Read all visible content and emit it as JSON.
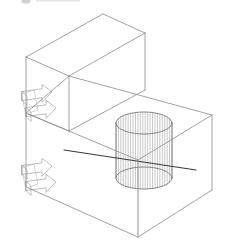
{
  "document": {
    "title": "3D Isometric Wireframe Assembly",
    "description": "Line-art technical drawing of two stacked rectangular enclosures in isometric projection with an internal wireframe cylinder and four 3D flow arrows",
    "background_color": "#ffffff",
    "width": 226,
    "height": 248
  },
  "style": {
    "line_color": "#8a8a8a",
    "line_color_dark": "#3a3a3a",
    "line_color_light": "#b4b4b4",
    "cylinder_line_color": "#9a9a9a",
    "cylinder_outline_color": "#6e6e6e",
    "arrow_color": "#8a8a8a",
    "stroke_width": "0.8",
    "stroke_width_thin": "0.55",
    "stroke_width_dark": "1.1"
  },
  "artifact": {
    "name": "cropped-header-mark",
    "label": "",
    "color": "#cfcfcf",
    "x": 22,
    "y": 0,
    "width": 8,
    "height": 4
  },
  "upper_box": {
    "name": "upper-enclosure",
    "label": "Upper enclosure",
    "vertices": {
      "top_back": [
        103,
        14
      ],
      "top_right": [
        145,
        33
      ],
      "top_left": [
        26,
        57
      ],
      "top_front": [
        69,
        76
      ],
      "bottom_left": [
        26,
        113
      ],
      "bottom_front": [
        69,
        131
      ],
      "bottom_right": [
        145,
        90
      ]
    },
    "edges": [
      "top_back-top_right",
      "top_back-top_left",
      "top_left-top_front",
      "top_front-top_right",
      "top_left-bottom_left",
      "top_front-bottom_front",
      "top_right-bottom_right",
      "bottom_left-bottom_front",
      "bottom_front-bottom_right"
    ]
  },
  "lower_box": {
    "name": "lower-enclosure",
    "label": "Lower enclosure",
    "vertices": {
      "top_back": [
        69,
        76
      ],
      "top_right": [
        212,
        115
      ],
      "top_left": [
        26,
        113
      ],
      "top_front": [
        138,
        160
      ],
      "bottom_left": [
        26,
        187
      ],
      "bottom_front": [
        138,
        237
      ],
      "bottom_right": [
        212,
        190
      ]
    },
    "edges": [
      "top_back-top_right",
      "top_back-top_left",
      "top_left-top_front",
      "top_front-top_right",
      "top_left-bottom_left",
      "top_front-bottom_front",
      "top_right-bottom_right",
      "bottom_left-bottom_front",
      "bottom_front-bottom_right"
    ]
  },
  "cylinder": {
    "name": "wireframe-cylinder",
    "label": "Internal cylinder",
    "center_x": 144,
    "top_center_y": 123,
    "bottom_center_y": 178,
    "radius_x": 28,
    "radius_y": 11,
    "generatrix_count": 24,
    "height": 55
  },
  "diagonal_guide": {
    "name": "diagonal-axis-line",
    "label": "Diagonal reference axis",
    "from": [
      64,
      150
    ],
    "to": [
      196,
      170
    ],
    "color": "#3a3a3a"
  },
  "vertical_guide": {
    "name": "vertical-axis-line",
    "label": "Vertical reference axis",
    "from": [
      138,
      160
    ],
    "to": [
      138,
      237
    ]
  },
  "arrows": {
    "name": "flow-arrow-group",
    "label": "Flow direction arrows",
    "groups": [
      {
        "name": "upper-arrow-pair",
        "label": "Upper inlet/outlet arrows",
        "base_x": 22,
        "base_y": 108,
        "arrows": [
          {
            "name": "upper-arrow-in",
            "label": "inlet",
            "dx": 0,
            "dy": -12
          },
          {
            "name": "upper-arrow-out",
            "label": "outlet",
            "dx": 4,
            "dy": 4
          }
        ]
      },
      {
        "name": "lower-arrow-pair",
        "label": "Lower inlet/outlet arrows",
        "base_x": 22,
        "base_y": 182,
        "arrows": [
          {
            "name": "lower-arrow-in",
            "label": "inlet",
            "dx": 0,
            "dy": -12
          },
          {
            "name": "lower-arrow-out",
            "label": "outlet",
            "dx": 4,
            "dy": 4
          }
        ]
      }
    ]
  }
}
